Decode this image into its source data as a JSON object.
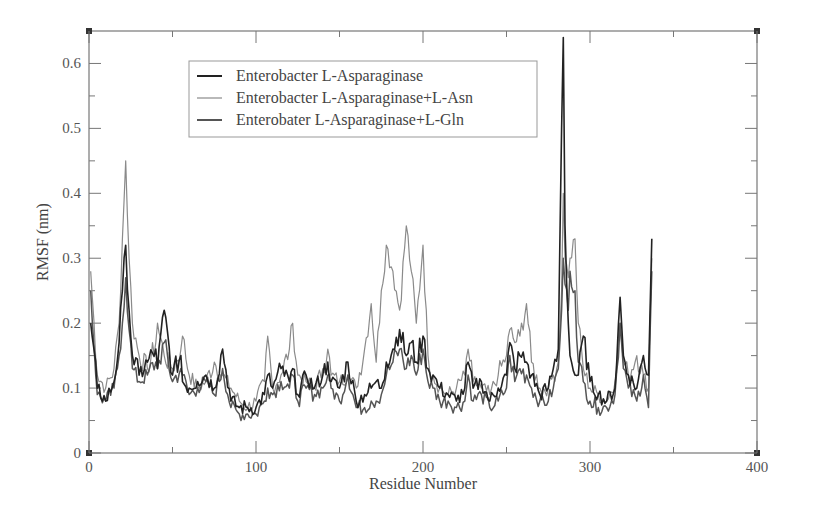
{
  "chart_data": {
    "type": "line",
    "title": "",
    "xlabel": "Residue Number",
    "ylabel": "RMSF (nm)",
    "xlim": [
      0,
      400
    ],
    "ylim": [
      0,
      0.65
    ],
    "xticks": [
      0,
      100,
      200,
      300,
      400
    ],
    "xtick_labels": [
      "0",
      "100",
      "200",
      "300",
      "400"
    ],
    "yticks": [
      0,
      0.1,
      0.2,
      0.3,
      0.4,
      0.5,
      0.6
    ],
    "ytick_labels": [
      "0",
      "0.1",
      "0.2",
      "0.3",
      "0.4",
      "0.5",
      "0.6"
    ],
    "grid": false,
    "legend_position": "upper-left-inside",
    "x": [
      1,
      5,
      10,
      15,
      18,
      20,
      22,
      24,
      26,
      30,
      35,
      40,
      41,
      45,
      50,
      55,
      56,
      60,
      65,
      70,
      75,
      80,
      85,
      90,
      95,
      100,
      105,
      107,
      110,
      115,
      120,
      122,
      125,
      130,
      135,
      140,
      143,
      145,
      150,
      155,
      160,
      165,
      169,
      172,
      175,
      178,
      182,
      186,
      190,
      193,
      196,
      200,
      203,
      206,
      210,
      215,
      220,
      225,
      227,
      230,
      235,
      240,
      245,
      250,
      252,
      255,
      258,
      262,
      265,
      270,
      275,
      278,
      281,
      283,
      284,
      285,
      287,
      288,
      291,
      293,
      296,
      300,
      305,
      310,
      315,
      318,
      320,
      323,
      328,
      332,
      335,
      337
    ],
    "series": [
      {
        "name": "Enterobacter L-Asparaginase",
        "color": "#222222",
        "values": [
          0.2,
          0.1,
          0.08,
          0.11,
          0.17,
          0.25,
          0.32,
          0.22,
          0.15,
          0.12,
          0.14,
          0.16,
          0.13,
          0.22,
          0.12,
          0.15,
          0.11,
          0.1,
          0.11,
          0.12,
          0.1,
          0.16,
          0.08,
          0.07,
          0.07,
          0.07,
          0.09,
          0.12,
          0.1,
          0.13,
          0.11,
          0.13,
          0.09,
          0.12,
          0.1,
          0.12,
          0.14,
          0.11,
          0.1,
          0.14,
          0.08,
          0.09,
          0.1,
          0.11,
          0.1,
          0.14,
          0.16,
          0.19,
          0.15,
          0.17,
          0.14,
          0.18,
          0.13,
          0.12,
          0.1,
          0.09,
          0.08,
          0.1,
          0.14,
          0.1,
          0.11,
          0.08,
          0.1,
          0.12,
          0.17,
          0.13,
          0.15,
          0.14,
          0.12,
          0.09,
          0.1,
          0.13,
          0.16,
          0.5,
          0.64,
          0.35,
          0.2,
          0.15,
          0.12,
          0.12,
          0.18,
          0.11,
          0.09,
          0.08,
          0.1,
          0.24,
          0.15,
          0.12,
          0.1,
          0.15,
          0.12,
          0.33
        ]
      },
      {
        "name": "Enterobacter L-Asparaginase+L-Asn",
        "color": "#8a8a8a",
        "values": [
          0.28,
          0.12,
          0.1,
          0.13,
          0.2,
          0.33,
          0.45,
          0.3,
          0.2,
          0.15,
          0.13,
          0.17,
          0.2,
          0.15,
          0.13,
          0.16,
          0.18,
          0.12,
          0.1,
          0.11,
          0.14,
          0.12,
          0.1,
          0.08,
          0.07,
          0.08,
          0.11,
          0.18,
          0.1,
          0.12,
          0.16,
          0.2,
          0.12,
          0.11,
          0.1,
          0.13,
          0.16,
          0.12,
          0.11,
          0.12,
          0.1,
          0.16,
          0.23,
          0.14,
          0.25,
          0.32,
          0.28,
          0.22,
          0.35,
          0.28,
          0.2,
          0.32,
          0.15,
          0.12,
          0.1,
          0.09,
          0.1,
          0.12,
          0.16,
          0.11,
          0.1,
          0.09,
          0.12,
          0.15,
          0.19,
          0.17,
          0.18,
          0.23,
          0.14,
          0.1,
          0.1,
          0.12,
          0.14,
          0.25,
          0.4,
          0.3,
          0.27,
          0.3,
          0.33,
          0.2,
          0.13,
          0.1,
          0.09,
          0.08,
          0.11,
          0.2,
          0.14,
          0.12,
          0.15,
          0.12,
          0.1,
          0.3
        ]
      },
      {
        "name": "Enterobater L-Asparaginase+L-Gln",
        "color": "#555555",
        "values": [
          0.25,
          0.09,
          0.08,
          0.1,
          0.15,
          0.2,
          0.27,
          0.19,
          0.13,
          0.11,
          0.12,
          0.14,
          0.13,
          0.17,
          0.11,
          0.13,
          0.12,
          0.09,
          0.1,
          0.11,
          0.09,
          0.13,
          0.07,
          0.06,
          0.06,
          0.06,
          0.08,
          0.1,
          0.09,
          0.11,
          0.1,
          0.12,
          0.08,
          0.1,
          0.09,
          0.1,
          0.12,
          0.1,
          0.08,
          0.12,
          0.07,
          0.07,
          0.08,
          0.08,
          0.09,
          0.12,
          0.14,
          0.16,
          0.13,
          0.15,
          0.12,
          0.16,
          0.11,
          0.1,
          0.08,
          0.08,
          0.07,
          0.08,
          0.12,
          0.08,
          0.09,
          0.07,
          0.08,
          0.1,
          0.15,
          0.11,
          0.13,
          0.12,
          0.1,
          0.08,
          0.08,
          0.1,
          0.13,
          0.22,
          0.3,
          0.26,
          0.22,
          0.28,
          0.25,
          0.14,
          0.11,
          0.08,
          0.07,
          0.07,
          0.09,
          0.2,
          0.13,
          0.1,
          0.08,
          0.12,
          0.07,
          0.28
        ]
      }
    ]
  },
  "legend": {
    "items": [
      {
        "label": "Enterobacter L-Asparaginase",
        "color": "#222222"
      },
      {
        "label": "Enterobacter L-Asparaginase+L-Asn",
        "color": "#8a8a8a"
      },
      {
        "label": "Enterobater L-Asparaginase+L-Gln",
        "color": "#555555"
      }
    ]
  },
  "axes": {
    "xlabel": "Residue Number",
    "ylabel": "RMSF (nm)"
  }
}
